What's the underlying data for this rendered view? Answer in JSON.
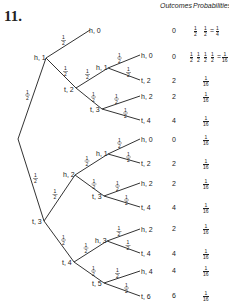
{
  "problem_number": "11.",
  "headers": {
    "outcomes": "Outcomes",
    "probabilities": "Probabilities"
  },
  "branch_probability": "1/2",
  "tree": {
    "root": {
      "x": 18,
      "y": 139
    },
    "edges": [
      [
        18,
        139,
        46,
        58
      ],
      [
        46,
        58,
        90,
        30
      ],
      [
        46,
        58,
        76,
        88
      ],
      [
        76,
        88,
        108,
        68
      ],
      [
        108,
        68,
        140,
        55
      ],
      [
        108,
        68,
        140,
        80
      ],
      [
        76,
        88,
        102,
        109
      ],
      [
        102,
        109,
        140,
        96
      ],
      [
        102,
        109,
        140,
        120
      ],
      [
        18,
        139,
        44,
        221
      ],
      [
        44,
        221,
        75,
        175
      ],
      [
        75,
        175,
        108,
        154
      ],
      [
        108,
        154,
        140,
        139
      ],
      [
        108,
        154,
        140,
        163
      ],
      [
        75,
        175,
        104,
        196
      ],
      [
        104,
        196,
        140,
        183
      ],
      [
        104,
        196,
        140,
        207
      ],
      [
        44,
        221,
        74,
        262
      ],
      [
        74,
        262,
        107,
        241
      ],
      [
        107,
        241,
        140,
        229
      ],
      [
        107,
        241,
        140,
        253
      ],
      [
        74,
        262,
        104,
        283
      ],
      [
        104,
        283,
        140,
        271
      ],
      [
        104,
        283,
        140,
        296
      ]
    ],
    "labels": [
      {
        "text": "h, 1",
        "x": 34,
        "y": 60
      },
      {
        "text": "h, 0",
        "x": 89,
        "y": 33
      },
      {
        "text": "t, 2",
        "x": 64,
        "y": 92
      },
      {
        "text": "h, 1",
        "x": 96,
        "y": 70
      },
      {
        "text": "h, 0",
        "x": 141,
        "y": 58
      },
      {
        "text": "t, 2",
        "x": 141,
        "y": 83
      },
      {
        "text": "t, 3",
        "x": 90,
        "y": 112
      },
      {
        "text": "h, 2",
        "x": 141,
        "y": 99
      },
      {
        "text": "t, 4",
        "x": 141,
        "y": 123
      },
      {
        "text": "t, 3",
        "x": 32,
        "y": 224
      },
      {
        "text": "h, 2",
        "x": 63,
        "y": 177
      },
      {
        "text": "h, 1",
        "x": 96,
        "y": 156
      },
      {
        "text": "h, 0",
        "x": 141,
        "y": 142
      },
      {
        "text": "t, 2",
        "x": 141,
        "y": 166
      },
      {
        "text": "t, 3",
        "x": 92,
        "y": 199
      },
      {
        "text": "h, 2",
        "x": 141,
        "y": 186
      },
      {
        "text": "t, 4",
        "x": 141,
        "y": 210
      },
      {
        "text": "t, 4",
        "x": 62,
        "y": 265
      },
      {
        "text": "h, 3",
        "x": 95,
        "y": 243
      },
      {
        "text": "h, 2",
        "x": 141,
        "y": 232
      },
      {
        "text": "t, 4",
        "x": 141,
        "y": 256
      },
      {
        "text": "t, 5",
        "x": 92,
        "y": 286
      },
      {
        "text": "h, 4",
        "x": 141,
        "y": 274
      },
      {
        "text": "t, 6",
        "x": 141,
        "y": 299
      }
    ]
  },
  "rows": [
    {
      "outcome": "0",
      "probability": "1/2 · 1/2 = 1/4",
      "y": 31
    },
    {
      "outcome": "0",
      "probability": "1/2 · 1/2 · 1/2 · 1/2 = 1/16",
      "y": 57
    },
    {
      "outcome": "2",
      "probability": "1/16",
      "y": 81
    },
    {
      "outcome": "2",
      "probability": "1/16",
      "y": 97
    },
    {
      "outcome": "4",
      "probability": "1/16",
      "y": 121
    },
    {
      "outcome": "0",
      "probability": "1/16",
      "y": 140
    },
    {
      "outcome": "2",
      "probability": "1/16",
      "y": 164
    },
    {
      "outcome": "2",
      "probability": "1/16",
      "y": 184
    },
    {
      "outcome": "4",
      "probability": "1/16",
      "y": 208
    },
    {
      "outcome": "2",
      "probability": "1/16",
      "y": 229
    },
    {
      "outcome": "4",
      "probability": "1/16",
      "y": 254
    },
    {
      "outcome": "4",
      "probability": "1/16",
      "y": 271
    },
    {
      "outcome": "6",
      "probability": "1/16",
      "y": 296
    }
  ]
}
